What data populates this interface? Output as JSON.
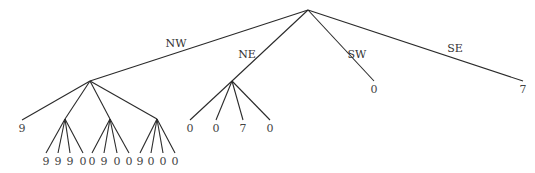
{
  "diagram": {
    "type": "tree",
    "root": {
      "x": 308,
      "y": 10
    },
    "edge_labels": [
      {
        "label": "NW",
        "x": 176,
        "y": 47
      },
      {
        "label": "NE",
        "x": 247,
        "y": 58
      },
      {
        "label": "SW",
        "x": 357,
        "y": 58
      },
      {
        "label": "SE",
        "x": 455,
        "y": 52
      }
    ],
    "nodes": [
      {
        "id": "root",
        "x": 308,
        "y": 10
      },
      {
        "id": "nw",
        "x": 90,
        "y": 81
      },
      {
        "id": "ne",
        "x": 232,
        "y": 81
      },
      {
        "id": "sw",
        "x": 374,
        "y": 81,
        "leaf_value": "0"
      },
      {
        "id": "se",
        "x": 523,
        "y": 81,
        "leaf_value": "7"
      },
      {
        "id": "nw-nw",
        "x": 22,
        "y": 120,
        "leaf_value": "9"
      },
      {
        "id": "nw-ne",
        "x": 65,
        "y": 119
      },
      {
        "id": "nw-sw",
        "x": 110,
        "y": 119
      },
      {
        "id": "nw-se",
        "x": 157,
        "y": 119
      },
      {
        "id": "ne-nw",
        "x": 190,
        "y": 120,
        "leaf_value": "0"
      },
      {
        "id": "ne-ne",
        "x": 216,
        "y": 120,
        "leaf_value": "0"
      },
      {
        "id": "ne-sw",
        "x": 243,
        "y": 120,
        "leaf_value": "7"
      },
      {
        "id": "ne-se",
        "x": 270,
        "y": 120,
        "leaf_value": "0"
      }
    ],
    "edges": [
      [
        "root",
        "nw"
      ],
      [
        "root",
        "ne"
      ],
      [
        "root",
        "sw"
      ],
      [
        "root",
        "se"
      ],
      [
        "nw",
        "nw-nw"
      ],
      [
        "nw",
        "nw-ne"
      ],
      [
        "nw",
        "nw-sw"
      ],
      [
        "nw",
        "nw-se"
      ],
      [
        "ne",
        "ne-nw"
      ],
      [
        "ne",
        "ne-ne"
      ],
      [
        "ne",
        "ne-sw"
      ],
      [
        "ne",
        "ne-se"
      ]
    ],
    "bottom_groups": [
      {
        "parent": "nw-ne",
        "px": 65,
        "py": 119,
        "leaves": [
          "9",
          "9",
          "9",
          "0"
        ],
        "xs": [
          46,
          58,
          70,
          83
        ]
      },
      {
        "parent": "nw-sw",
        "px": 110,
        "py": 119,
        "leaves": [
          "0",
          "9",
          "0",
          "0"
        ],
        "xs": [
          92,
          104,
          117,
          129
        ]
      },
      {
        "parent": "nw-se",
        "px": 157,
        "py": 119,
        "leaves": [
          "9",
          "0",
          "0",
          "0"
        ],
        "xs": [
          140,
          151,
          163,
          175
        ]
      }
    ],
    "leaf_row_y": 162
  }
}
